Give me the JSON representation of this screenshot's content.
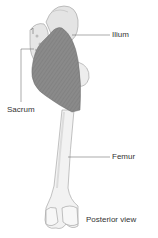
{
  "diagram": {
    "view_label": "Posterior view",
    "labels": [
      {
        "id": "ilium",
        "text": "Ilium"
      },
      {
        "id": "sacrum",
        "text": "Sacrum"
      },
      {
        "id": "femur",
        "text": "Femur"
      }
    ],
    "colors": {
      "muscle": "#8a8a8a",
      "muscle_stripe": "#7a7a7a",
      "bone": "#f0f0f0",
      "bone_shade": "#d8d8d8",
      "outline": "#9a9a9a",
      "leader_line": "#555555",
      "text": "#333333"
    }
  }
}
